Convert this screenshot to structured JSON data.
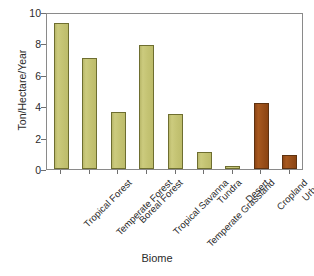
{
  "chart_data": {
    "type": "bar",
    "title": "",
    "xlabel": "Biome",
    "ylabel": "Ton/Hectare/Year",
    "categories": [
      "Tropical Forest",
      "Temperate Forest",
      "Boreal Forest",
      "Tropical Savanna",
      "Temperate Grassland",
      "Tundra",
      "Desert",
      "Cropland",
      "Urban"
    ],
    "values": [
      9.3,
      7.1,
      3.6,
      7.9,
      3.5,
      1.1,
      0.2,
      4.2,
      0.9
    ],
    "bar_colors": [
      "#c5c474",
      "#c5c474",
      "#c5c474",
      "#c5c474",
      "#c5c474",
      "#c5c474",
      "#c5c474",
      "#9a4f19",
      "#9a4f19"
    ],
    "bar_kinds": [
      "natural",
      "natural",
      "natural",
      "natural",
      "natural",
      "natural",
      "natural",
      "human",
      "human"
    ],
    "ylim": [
      0,
      10
    ],
    "yticks": [
      0,
      2,
      4,
      6,
      8,
      10
    ],
    "ytick_labels": [
      "0",
      "2",
      "4",
      "6",
      "8",
      "10"
    ],
    "grid": false,
    "legend": "none",
    "frame": true
  },
  "colors": {
    "natural_bar": "#c5c474",
    "natural_bar_edge": "#6e6e30",
    "human_bar": "#9a4f19",
    "human_bar_edge": "#5e3210",
    "axis": "#8a8a8a",
    "text": "#2b2b2b",
    "background": "#ffffff"
  }
}
